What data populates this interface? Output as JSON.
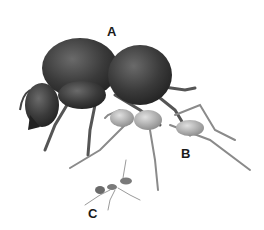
{
  "figure": {
    "labels": [
      {
        "id": "A",
        "text": "A"
      },
      {
        "id": "B",
        "text": "B"
      },
      {
        "id": "C",
        "text": "C"
      }
    ],
    "colors": {
      "background": "#ffffff",
      "ant_a": "#3a3a3a",
      "ant_b": "#9a9a9a",
      "ant_c": "#7a7a7a",
      "label": "#1a1a1a"
    }
  }
}
